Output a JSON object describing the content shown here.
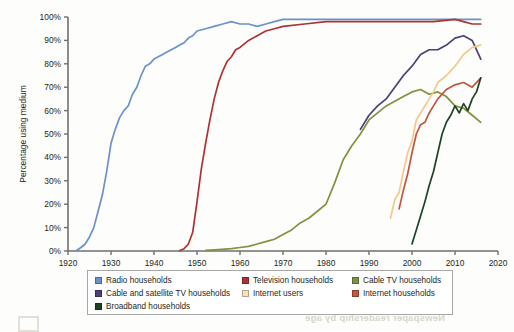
{
  "chart_data": {
    "type": "line",
    "title": "",
    "xlabel": "",
    "ylabel": "Percentage using medium",
    "xlim": [
      1920,
      2020
    ],
    "ylim": [
      0,
      100
    ],
    "xticks": [
      1920,
      1930,
      1940,
      1950,
      1960,
      1970,
      1980,
      1990,
      2000,
      2010,
      2020
    ],
    "yticks": [
      0,
      10,
      20,
      30,
      40,
      50,
      60,
      70,
      80,
      90,
      100
    ],
    "ytick_labels": [
      "0%",
      "10%",
      "20%",
      "30%",
      "40%",
      "50%",
      "60%",
      "70%",
      "80%",
      "90%",
      "100%"
    ],
    "xtick_labels": [
      "1920",
      "1930",
      "1940",
      "1950",
      "1960",
      "1970",
      "1980",
      "1990",
      "2000",
      "2010",
      "2020"
    ],
    "grid": false,
    "legend_position": "bottom",
    "series": [
      {
        "name": "Radio households",
        "color": "#6b92c8",
        "x": [
          1922,
          1923,
          1924,
          1925,
          1926,
          1927,
          1928,
          1929,
          1930,
          1931,
          1932,
          1933,
          1934,
          1935,
          1936,
          1937,
          1938,
          1939,
          1940,
          1941,
          1942,
          1943,
          1944,
          1945,
          1946,
          1947,
          1948,
          1949,
          1950,
          1952,
          1954,
          1956,
          1958,
          1960,
          1962,
          1964,
          1966,
          1968,
          1970,
          1975,
          1980,
          1985,
          1990,
          1995,
          2000,
          2005,
          2010,
          2016
        ],
        "y": [
          0.2,
          1.5,
          3,
          6,
          10,
          17,
          24,
          34,
          46,
          52,
          57,
          60,
          62,
          67,
          70,
          75,
          79,
          80,
          82,
          83,
          84,
          85,
          86,
          87,
          88,
          89,
          91,
          92,
          94,
          95,
          96,
          97,
          98,
          97,
          97,
          96,
          97,
          98,
          99,
          99,
          99,
          99,
          99,
          99,
          99,
          99,
          99,
          99
        ]
      },
      {
        "name": "Television households",
        "color": "#ad3235",
        "x": [
          1946,
          1947,
          1948,
          1949,
          1950,
          1951,
          1952,
          1953,
          1954,
          1955,
          1956,
          1957,
          1958,
          1959,
          1960,
          1962,
          1964,
          1966,
          1968,
          1970,
          1975,
          1980,
          1985,
          1990,
          1995,
          2000,
          2005,
          2010,
          2012,
          2014,
          2016
        ],
        "y": [
          0.2,
          1,
          3,
          8,
          21,
          35,
          46,
          56,
          65,
          72,
          77,
          81,
          83,
          86,
          87,
          90,
          92,
          94,
          95,
          96,
          97,
          98,
          98,
          98,
          98,
          98,
          98,
          99,
          98,
          97,
          97
        ]
      },
      {
        "name": "Cable TV households",
        "color": "#7f9340",
        "x": [
          1952,
          1955,
          1958,
          1960,
          1962,
          1964,
          1966,
          1968,
          1970,
          1972,
          1974,
          1976,
          1978,
          1980,
          1982,
          1984,
          1986,
          1988,
          1990,
          1992,
          1994,
          1996,
          1998,
          2000,
          2002,
          2004,
          2006,
          2008,
          2010,
          2012,
          2014,
          2016
        ],
        "y": [
          0.3,
          0.6,
          1,
          1.5,
          2,
          3,
          4,
          5,
          7,
          9,
          12,
          14,
          17,
          20,
          29,
          39,
          45,
          50,
          56,
          59,
          62,
          64,
          66,
          68,
          69,
          67,
          68,
          66,
          62,
          61,
          58,
          55
        ]
      },
      {
        "name": "Cable and satellite TV households",
        "color": "#4c3f7a",
        "x": [
          1988,
          1990,
          1992,
          1994,
          1996,
          1998,
          2000,
          2002,
          2004,
          2006,
          2008,
          2010,
          2012,
          2014,
          2016
        ],
        "y": [
          52,
          58,
          62,
          65,
          70,
          75,
          79,
          84,
          86,
          86,
          88,
          91,
          92,
          90,
          82
        ]
      },
      {
        "name": "Internet users",
        "color": "#f3c98b",
        "x": [
          1995,
          1996,
          1997,
          1998,
          1999,
          2000,
          2001,
          2002,
          2003,
          2004,
          2005,
          2006,
          2008,
          2010,
          2012,
          2014,
          2016
        ],
        "y": [
          14,
          22,
          25,
          34,
          42,
          47,
          56,
          59,
          62,
          65,
          68,
          72,
          75,
          79,
          84,
          87,
          88
        ]
      },
      {
        "name": "Internet households",
        "color": "#c0563f",
        "x": [
          1997,
          1998,
          1999,
          2000,
          2001,
          2002,
          2003,
          2004,
          2005,
          2006,
          2008,
          2010,
          2012,
          2014,
          2016
        ],
        "y": [
          18,
          26,
          33,
          42,
          50,
          54,
          55,
          59,
          62,
          65,
          69,
          71,
          72,
          70,
          74
        ]
      },
      {
        "name": "Broadband households",
        "color": "#1f4227",
        "x": [
          2000,
          2001,
          2002,
          2003,
          2004,
          2005,
          2006,
          2007,
          2008,
          2009,
          2010,
          2011,
          2012,
          2013,
          2014,
          2015,
          2016
        ],
        "y": [
          3,
          9,
          15,
          21,
          28,
          34,
          42,
          50,
          55,
          58,
          62,
          59,
          63,
          60,
          65,
          68,
          74
        ]
      }
    ]
  },
  "axis": {
    "y_title": "Percentage using medium"
  },
  "legend": {
    "rows": [
      [
        {
          "label": "Radio households",
          "color": "#6b92c8"
        },
        {
          "label": "Television households",
          "color": "#ad3235"
        },
        {
          "label": "Cable TV households",
          "color": "#7f9340"
        }
      ],
      [
        {
          "label": "Cable and satellite TV households",
          "color": "#4c3f7a"
        },
        {
          "label": "Internet users",
          "color": "#f6e3bd"
        },
        {
          "label": "Internet households",
          "color": "#c0563f"
        }
      ],
      [
        {
          "label": "Broadband households",
          "color": "#1f4227"
        }
      ]
    ]
  },
  "ghost_text": {
    "reversed_caption": "Newspaper readership by age"
  }
}
